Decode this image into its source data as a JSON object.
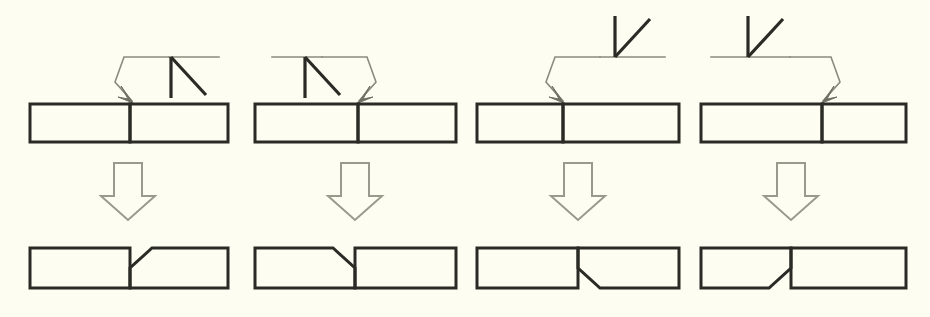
{
  "figure": {
    "kind": "welding-symbol-diagram",
    "title": "",
    "background_color": "#fdfdf2",
    "line_color_heavy": "#2b2b26",
    "line_color_light": "#8a8a7e",
    "arrow_color": "#6f6f63",
    "panel_count": 4,
    "rows": [
      "symbol-row",
      "transition-arrow-row",
      "result-row"
    ]
  },
  "panels": [
    {
      "id": "panel-1",
      "label": "",
      "symbol": {
        "name": "single-bevel-groove",
        "side": "below-reference-line",
        "arrow_side": "arrow-side",
        "reference_line_direction": "right",
        "leader_direction": "down-left",
        "arrow_target": "joint-root",
        "bevel_vertical_on": "right",
        "bevel_diagonal_direction": "down-right"
      },
      "joint_before": {
        "name": "butt-joint-square-plates",
        "left_plate": "square",
        "right_plate": "square"
      },
      "joint_after": {
        "name": "single-bevel-prepared-joint",
        "beveled_member": "right-plate",
        "bevel_face": "top",
        "bevel_slope": "down-left"
      }
    },
    {
      "id": "panel-2",
      "label": "",
      "symbol": {
        "name": "single-bevel-groove",
        "side": "below-reference-line",
        "arrow_side": "arrow-side",
        "reference_line_direction": "left",
        "leader_direction": "down-right",
        "arrow_target": "joint-root",
        "bevel_vertical_on": "left",
        "bevel_diagonal_direction": "down-right"
      },
      "joint_before": {
        "name": "butt-joint-square-plates",
        "left_plate": "square",
        "right_plate": "square"
      },
      "joint_after": {
        "name": "single-bevel-prepared-joint",
        "beveled_member": "left-plate",
        "bevel_face": "top",
        "bevel_slope": "down-right"
      }
    },
    {
      "id": "panel-3",
      "label": "",
      "symbol": {
        "name": "single-bevel-groove",
        "side": "above-reference-line",
        "arrow_side": "other-side",
        "reference_line_direction": "right",
        "leader_direction": "down-left",
        "arrow_target": "joint-root",
        "bevel_vertical_on": "left",
        "bevel_diagonal_direction": "up-right"
      },
      "joint_before": {
        "name": "butt-joint-square-plates",
        "left_plate": "square",
        "right_plate": "square"
      },
      "joint_after": {
        "name": "single-bevel-prepared-joint",
        "beveled_member": "right-plate",
        "bevel_face": "bottom",
        "bevel_slope": "up-left"
      }
    },
    {
      "id": "panel-4",
      "label": "",
      "symbol": {
        "name": "single-bevel-groove",
        "side": "above-reference-line",
        "arrow_side": "other-side",
        "reference_line_direction": "left",
        "leader_direction": "down-right",
        "arrow_target": "joint-root",
        "bevel_vertical_on": "left",
        "bevel_diagonal_direction": "up-right"
      },
      "joint_before": {
        "name": "butt-joint-square-plates",
        "left_plate": "square",
        "right_plate": "square"
      },
      "joint_after": {
        "name": "single-bevel-prepared-joint",
        "beveled_member": "left-plate",
        "bevel_face": "bottom",
        "bevel_slope": "up-right"
      }
    }
  ],
  "transition_arrows": [
    {
      "id": "arrow-1",
      "name": "block-down-arrow",
      "direction": "down"
    },
    {
      "id": "arrow-2",
      "name": "block-down-arrow",
      "direction": "down"
    },
    {
      "id": "arrow-3",
      "name": "block-down-arrow",
      "direction": "down"
    },
    {
      "id": "arrow-4",
      "name": "block-down-arrow",
      "direction": "down"
    }
  ]
}
